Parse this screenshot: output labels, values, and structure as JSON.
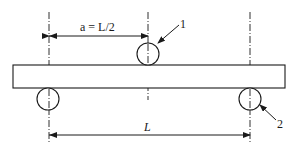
{
  "diagram": {
    "labels": {
      "top_dimension": "a = L/2",
      "span": "L",
      "callout_1": "1",
      "callout_2": "2"
    },
    "components": [
      {
        "id": "1",
        "name": "loading roller"
      },
      {
        "id": "2",
        "name": "support roller"
      }
    ],
    "colors": {
      "stroke": "#1a1a1a",
      "background": "#ffffff"
    }
  }
}
